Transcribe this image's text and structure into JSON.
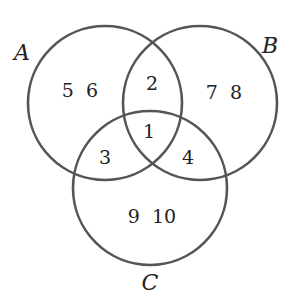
{
  "diagram": {
    "type": "venn",
    "sets": [
      {
        "name": "A",
        "label": "A",
        "cx": 105,
        "cy": 103,
        "r": 77,
        "label_x": 22,
        "label_y": 60
      },
      {
        "name": "B",
        "label": "B",
        "cx": 200,
        "cy": 103,
        "r": 77,
        "label_x": 270,
        "label_y": 53
      },
      {
        "name": "C",
        "label": "C",
        "cx": 150,
        "cy": 188,
        "r": 77,
        "label_x": 150,
        "label_y": 290
      }
    ],
    "regions": [
      {
        "id": "a_only",
        "sets": [
          "A"
        ],
        "text": "5  6",
        "x": 80,
        "y": 97
      },
      {
        "id": "a_b",
        "sets": [
          "A",
          "B"
        ],
        "text": "2",
        "x": 152,
        "y": 90
      },
      {
        "id": "b_only",
        "sets": [
          "B"
        ],
        "text": "7  8",
        "x": 224,
        "y": 99
      },
      {
        "id": "a_b_c",
        "sets": [
          "A",
          "B",
          "C"
        ],
        "text": "1",
        "x": 149,
        "y": 138
      },
      {
        "id": "a_c",
        "sets": [
          "A",
          "C"
        ],
        "text": "3",
        "x": 105,
        "y": 164
      },
      {
        "id": "b_c",
        "sets": [
          "B",
          "C"
        ],
        "text": "4",
        "x": 188,
        "y": 164
      },
      {
        "id": "c_only",
        "sets": [
          "C"
        ],
        "text": "9  10",
        "x": 152,
        "y": 223
      }
    ],
    "stroke_color": "#555555"
  }
}
